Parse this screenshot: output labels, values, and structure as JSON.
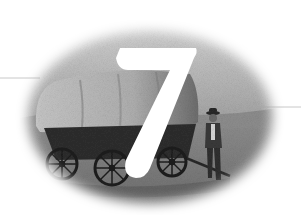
{
  "illustration": {
    "subject": "covered wagon with a man standing beside it",
    "style": "halftone grayscale oval vignette",
    "chapter_number": "7",
    "colors": {
      "background": "#ffffff",
      "sky_light": "#d9d9d9",
      "sky_dark": "#9a9a9a",
      "ground": "#7a7a7a",
      "wagon_cover": "#b8b8b8",
      "wagon_body": "#2e2e2e",
      "numeral": "#ffffff",
      "rule": "#c8c8c8"
    }
  }
}
